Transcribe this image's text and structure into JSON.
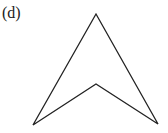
{
  "figure": {
    "label": "(d)",
    "shape": {
      "type": "concave-quadrilateral-arrowhead",
      "vertices": [
        [
          96,
          14
        ],
        [
          158,
          124
        ],
        [
          96,
          84
        ],
        [
          33,
          125
        ]
      ],
      "stroke": "#222222",
      "stroke_width": 1.3,
      "fill": "none"
    }
  }
}
